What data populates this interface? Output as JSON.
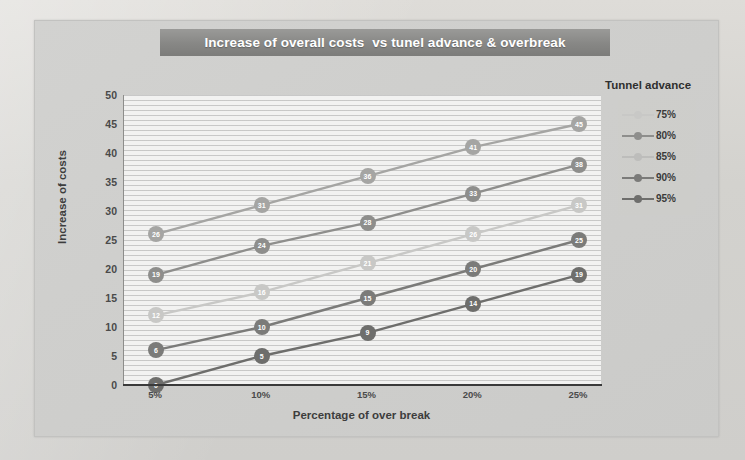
{
  "chart_data": {
    "type": "line",
    "title": "Increase of overall costs  vs tunel advance & overbreak",
    "xlabel": "Percentage of over break",
    "ylabel": "Increase of costs",
    "categories": [
      "5%",
      "10%",
      "15%",
      "20%",
      "25%"
    ],
    "xticklabels": [
      "5%",
      "10%",
      "15%",
      "20%",
      "25%"
    ],
    "yticklabels": [
      "0",
      "5",
      "10",
      "15",
      "20",
      "25",
      "30",
      "35",
      "40",
      "45",
      "50"
    ],
    "ylim": [
      0,
      50
    ],
    "ystep": 5,
    "grid": "horizontal",
    "legend_position": "right",
    "legend_title": "Tunnel advance",
    "series": [
      {
        "name": "75%",
        "color": "#c8c8c6",
        "values": [
          12,
          16,
          21,
          26,
          31
        ]
      },
      {
        "name": "80%",
        "color": "#8e8e8c",
        "values": [
          19,
          24,
          28,
          33,
          38
        ]
      },
      {
        "name": "85%",
        "color": "#a5a5a3",
        "values": [
          26,
          31,
          36,
          41,
          45
        ]
      },
      {
        "name": "90%",
        "color": "#7b7b79",
        "values": [
          6,
          10,
          15,
          20,
          25
        ]
      },
      {
        "name": "95%",
        "color": "#6e6e6c",
        "values": [
          0,
          5,
          9,
          14,
          19
        ]
      }
    ]
  },
  "legend": {
    "title": "Tunnel advance",
    "entries": [
      {
        "label": "75%",
        "color": "#c8c8c6"
      },
      {
        "label": "80%",
        "color": "#8e8e8c"
      },
      {
        "label": "85%",
        "color": "#bdbdbb"
      },
      {
        "label": "90%",
        "color": "#7b7b79"
      },
      {
        "label": "95%",
        "color": "#6e6e6c"
      }
    ]
  },
  "colors": {
    "title_bar_bg": "#878785",
    "title_bar_text": "#ffffff",
    "plot_bg": "#f2f2f1",
    "card_bg": "#cfcfcd",
    "axis": "#3a3a3a"
  }
}
